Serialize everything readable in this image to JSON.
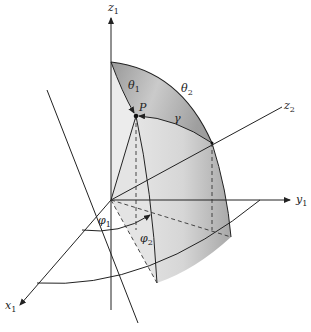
{
  "figure": {
    "labels": {
      "z1": {
        "base": "z",
        "sub": "1"
      },
      "z2": {
        "base": "z",
        "sub": "2"
      },
      "y1": {
        "base": "y",
        "sub": "1"
      },
      "x1": {
        "base": "x",
        "sub": "1"
      },
      "theta1": {
        "base": "θ",
        "sub": "1"
      },
      "theta2": {
        "base": "θ",
        "sub": "2"
      },
      "phi1": {
        "base": "φ",
        "sub": "1"
      },
      "phi2": {
        "base": "φ",
        "sub": "2"
      },
      "gamma": {
        "base": "γ",
        "sub": ""
      },
      "P": {
        "base": "P",
        "sub": ""
      }
    },
    "colors": {
      "line": "#222222",
      "surface_light": "#e6e6e6",
      "surface_dark": "#9a9a9a",
      "background": "#ffffff"
    }
  }
}
